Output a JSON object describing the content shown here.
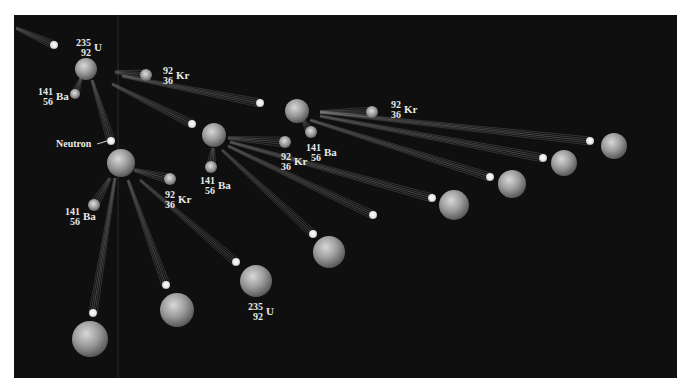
{
  "figure": {
    "background_color": "#0f0f0f",
    "labels": {
      "neutron": "Neutron"
    },
    "isotopes": [
      {
        "id": "u235-top",
        "mass": "235",
        "z": "92",
        "symbol": "U",
        "x": 73,
        "y": 38
      },
      {
        "id": "ba-1",
        "mass": "141",
        "z": "56",
        "symbol": "Ba",
        "x": 35,
        "y": 87
      },
      {
        "id": "kr-1",
        "mass": "92",
        "z": "36",
        "symbol": "Kr",
        "x": 155,
        "y": 66
      },
      {
        "id": "kr-2",
        "mass": "92",
        "z": "36",
        "symbol": "Kr",
        "x": 383,
        "y": 100
      },
      {
        "id": "ba-2",
        "mass": "141",
        "z": "56",
        "symbol": "Ba",
        "x": 303,
        "y": 143
      },
      {
        "id": "kr-3",
        "mass": "92",
        "z": "36",
        "symbol": "Kr",
        "x": 273,
        "y": 152
      },
      {
        "id": "ba-3",
        "mass": "141",
        "z": "56",
        "symbol": "Ba",
        "x": 197,
        "y": 176
      },
      {
        "id": "kr-4",
        "mass": "92",
        "z": "36",
        "symbol": "Kr",
        "x": 157,
        "y": 190
      },
      {
        "id": "ba-4",
        "mass": "141",
        "z": "56",
        "symbol": "Ba",
        "x": 62,
        "y": 207
      },
      {
        "id": "u235-bottom",
        "mass": "235",
        "z": "92",
        "symbol": "U",
        "x": 245,
        "y": 302
      }
    ],
    "nuclei": [
      {
        "id": "u-1",
        "type": "U-235",
        "cx": 86,
        "cy": 69,
        "r": 11
      },
      {
        "id": "u-2",
        "type": "U-235",
        "cx": 121,
        "cy": 163,
        "r": 14
      },
      {
        "id": "u-3",
        "type": "U-235",
        "cx": 214,
        "cy": 135,
        "r": 12
      },
      {
        "id": "u-4",
        "type": "U-235",
        "cx": 297,
        "cy": 111,
        "r": 12
      },
      {
        "id": "u-5",
        "type": "U-235",
        "cx": 614,
        "cy": 146,
        "r": 13
      },
      {
        "id": "u-6",
        "type": "U-235",
        "cx": 564,
        "cy": 163,
        "r": 13
      },
      {
        "id": "u-7",
        "type": "U-235",
        "cx": 512,
        "cy": 184,
        "r": 14
      },
      {
        "id": "u-8",
        "type": "U-235",
        "cx": 454,
        "cy": 205,
        "r": 15
      },
      {
        "id": "u-9",
        "type": "U-235",
        "cx": 329,
        "cy": 252,
        "r": 16
      },
      {
        "id": "u-10",
        "type": "U-235",
        "cx": 256,
        "cy": 281,
        "r": 16
      },
      {
        "id": "u-11",
        "type": "U-235",
        "cx": 177,
        "cy": 310,
        "r": 17
      },
      {
        "id": "u-12",
        "type": "U-235",
        "cx": 90,
        "cy": 339,
        "r": 18
      }
    ],
    "fragments": [
      {
        "id": "kr-f1",
        "cx": 146,
        "cy": 75,
        "r": 6,
        "tail_from": [
          115,
          72
        ]
      },
      {
        "id": "ba-f1",
        "cx": 75,
        "cy": 94,
        "r": 5,
        "tail_from": [
          81,
          78
        ]
      },
      {
        "id": "kr-f2",
        "cx": 372,
        "cy": 112,
        "r": 6,
        "tail_from": [
          320,
          112
        ]
      },
      {
        "id": "ba-f2",
        "cx": 311,
        "cy": 132,
        "r": 6,
        "tail_from": [
          303,
          120
        ]
      },
      {
        "id": "kr-f3",
        "cx": 285,
        "cy": 142,
        "r": 6,
        "tail_from": [
          228,
          138
        ]
      },
      {
        "id": "ba-f3",
        "cx": 211,
        "cy": 167,
        "r": 6,
        "tail_from": [
          213,
          148
        ]
      },
      {
        "id": "kr-f4",
        "cx": 170,
        "cy": 179,
        "r": 6,
        "tail_from": [
          134,
          170
        ]
      },
      {
        "id": "ba-f4",
        "cx": 94,
        "cy": 205,
        "r": 6,
        "tail_from": [
          110,
          178
        ]
      }
    ],
    "neutrons": [
      {
        "id": "n-0",
        "cx": 54,
        "cy": 45,
        "r": 4,
        "tail_from": [
          16,
          28
        ]
      },
      {
        "id": "n-1",
        "cx": 111,
        "cy": 141,
        "r": 4,
        "tail_from": [
          92,
          80
        ]
      },
      {
        "id": "n-2",
        "cx": 260,
        "cy": 103,
        "r": 4,
        "tail_from": [
          122,
          76
        ]
      },
      {
        "id": "n-3",
        "cx": 192,
        "cy": 124,
        "r": 4,
        "tail_from": [
          112,
          84
        ]
      },
      {
        "id": "n-4",
        "cx": 590,
        "cy": 141,
        "r": 4,
        "tail_from": [
          320,
          112
        ]
      },
      {
        "id": "n-5",
        "cx": 543,
        "cy": 158,
        "r": 4,
        "tail_from": [
          320,
          116
        ]
      },
      {
        "id": "n-6",
        "cx": 490,
        "cy": 177,
        "r": 4,
        "tail_from": [
          310,
          120
        ]
      },
      {
        "id": "n-7",
        "cx": 432,
        "cy": 198,
        "r": 4,
        "tail_from": [
          230,
          142
        ]
      },
      {
        "id": "n-8",
        "cx": 373,
        "cy": 215,
        "r": 4,
        "tail_from": [
          228,
          146
        ]
      },
      {
        "id": "n-9",
        "cx": 313,
        "cy": 234,
        "r": 4,
        "tail_from": [
          222,
          150
        ]
      },
      {
        "id": "n-10",
        "cx": 236,
        "cy": 262,
        "r": 4,
        "tail_from": [
          140,
          180
        ]
      },
      {
        "id": "n-11",
        "cx": 166,
        "cy": 285,
        "r": 4,
        "tail_from": [
          128,
          180
        ]
      },
      {
        "id": "n-12",
        "cx": 93,
        "cy": 313,
        "r": 4,
        "tail_from": [
          115,
          178
        ]
      }
    ],
    "neutron_label_pointer": {
      "x1": 97,
      "y1": 144,
      "x2": 107,
      "y2": 141
    }
  }
}
